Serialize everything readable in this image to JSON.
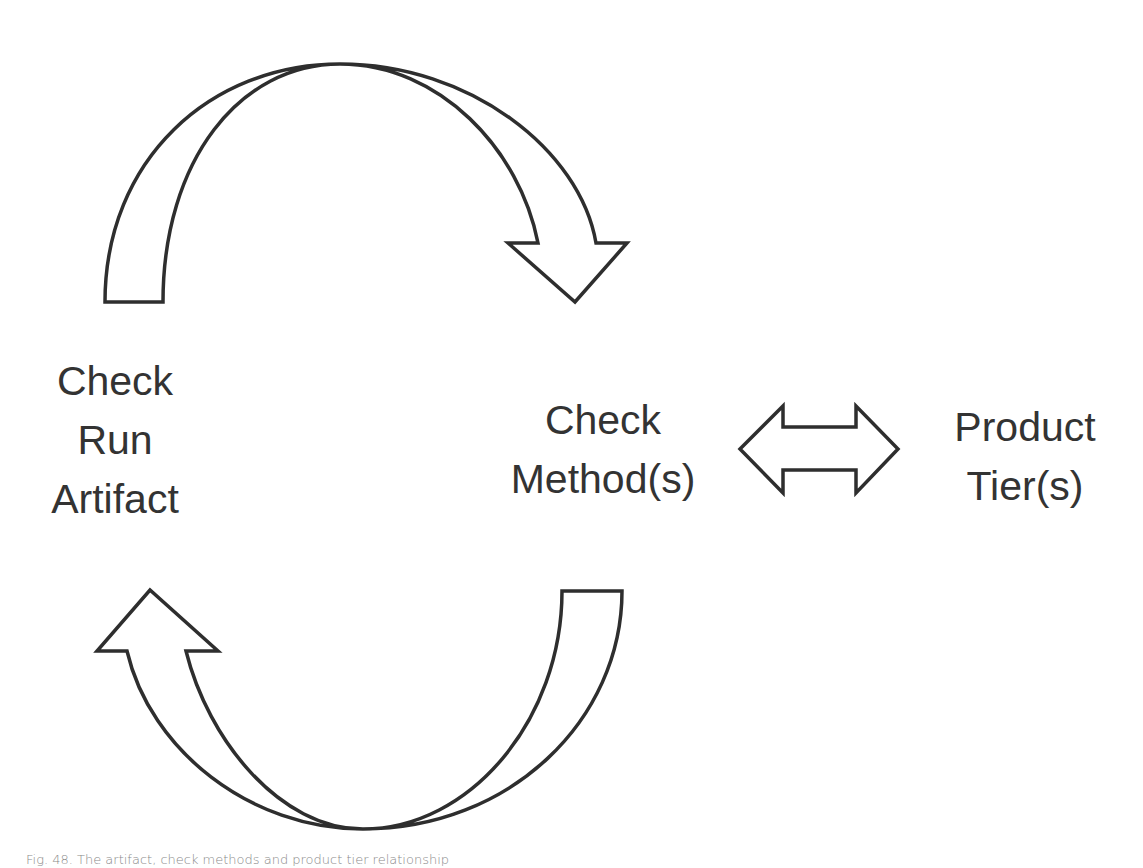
{
  "diagram": {
    "nodes": [
      {
        "id": "artifact",
        "lines": [
          "Check",
          "Run",
          "Artifact"
        ]
      },
      {
        "id": "methods",
        "lines": [
          "Check",
          "Method(s)"
        ]
      },
      {
        "id": "tier",
        "lines": [
          "Product",
          "Tier(s)"
        ]
      }
    ],
    "edges": [
      {
        "from": "artifact",
        "to": "methods",
        "shape": "curved-arrow-top",
        "direction": "clockwise"
      },
      {
        "from": "methods",
        "to": "artifact",
        "shape": "curved-arrow-bottom",
        "direction": "clockwise"
      },
      {
        "from": "methods",
        "to": "tier",
        "shape": "double-headed-arrow",
        "direction": "bidirectional"
      }
    ],
    "colors": {
      "stroke": "#2e2e2e",
      "fill": "#ffffff",
      "text": "#333333",
      "caption": "#8a8a8a"
    }
  },
  "caption": {
    "text": "Fig. 48. The artifact, check methods and product tier relationship"
  }
}
